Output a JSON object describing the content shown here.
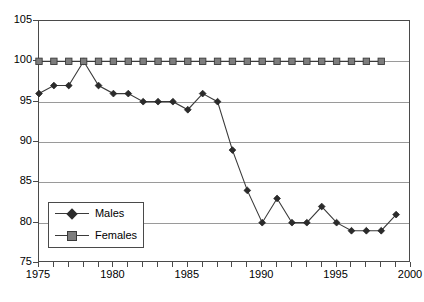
{
  "chart_data": {
    "type": "line",
    "title": "",
    "xlabel": "",
    "ylabel": "",
    "xlim": [
      1975,
      2000
    ],
    "ylim": [
      75,
      105
    ],
    "ytick_step": 5,
    "xtick_step": 1,
    "xlabel_step": 5,
    "yticks": [
      75,
      80,
      85,
      90,
      95,
      100,
      105
    ],
    "xticks": [
      1975,
      1976,
      1977,
      1978,
      1979,
      1980,
      1981,
      1982,
      1983,
      1984,
      1985,
      1986,
      1987,
      1988,
      1989,
      1990,
      1991,
      1992,
      1993,
      1994,
      1995,
      1996,
      1997,
      1998,
      1999,
      2000
    ],
    "xtick_labels": [
      "1975",
      "1980",
      "1985",
      "1990",
      "1995",
      "2000"
    ],
    "xtick_label_values": [
      1975,
      1980,
      1985,
      1990,
      1995,
      2000
    ],
    "grid": true,
    "grid_axis": "y",
    "legend_position": "lower-left-inside",
    "series": [
      {
        "name": "Males",
        "marker": "diamond",
        "color": "#2b2b2b",
        "x": [
          1975,
          1976,
          1977,
          1978,
          1979,
          1980,
          1981,
          1982,
          1983,
          1984,
          1985,
          1986,
          1987,
          1988,
          1989,
          1990,
          1991,
          1992,
          1993,
          1994,
          1995,
          1996,
          1997,
          1998,
          1999
        ],
        "values": [
          96,
          97,
          97,
          100,
          97,
          96,
          96,
          95,
          95,
          95,
          94,
          96,
          95,
          89,
          84,
          80,
          83,
          80,
          80,
          82,
          80,
          79,
          79,
          79,
          81
        ]
      },
      {
        "name": "Females",
        "marker": "square",
        "color": "#7d7d7d",
        "x": [
          1975,
          1976,
          1977,
          1978,
          1979,
          1980,
          1981,
          1982,
          1983,
          1984,
          1985,
          1986,
          1987,
          1988,
          1989,
          1990,
          1991,
          1992,
          1993,
          1994,
          1995,
          1996,
          1997,
          1998
        ],
        "values": [
          100,
          100,
          100,
          100,
          100,
          100,
          100,
          100,
          100,
          100,
          100,
          100,
          100,
          100,
          100,
          100,
          100,
          100,
          100,
          100,
          100,
          100,
          100,
          100
        ]
      }
    ],
    "legend": [
      {
        "label": "Males",
        "marker": "diamond"
      },
      {
        "label": "Females",
        "marker": "square"
      }
    ]
  }
}
